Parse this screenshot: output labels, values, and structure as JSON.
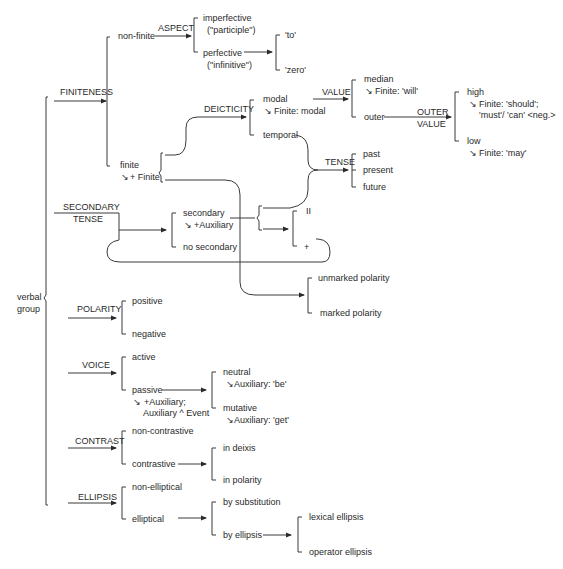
{
  "root": {
    "label_line1": "verbal",
    "label_line2": "group"
  },
  "systems": {
    "finiteness": "FINITENESS",
    "aspect": "ASPECT",
    "deicticity": "DEICTICITY",
    "value": "VALUE",
    "outer_value_line1": "OUTER",
    "outer_value_line2": "VALUE",
    "tense": "TENSE",
    "secondary_tense_line1": "SECONDARY",
    "secondary_tense_line2": "TENSE",
    "polarity": "POLARITY",
    "voice": "VOICE",
    "contrast": "CONTRAST",
    "ellipsis": "ELLIPSIS"
  },
  "features": {
    "non_finite": "non-finite",
    "imperfective": "imperfective",
    "imperfective_gloss": "(\"participle\")",
    "perfective": "perfective",
    "perfective_gloss": "(\"infinitive\")",
    "to": "'to'",
    "zero": "'zero'",
    "finite": "finite",
    "finite_realization": "+ Finite",
    "modal": "modal",
    "modal_realization": "Finite: modal",
    "temporal": "temporal",
    "median": "median",
    "median_realization": "Finite: 'will'",
    "outer": "outer",
    "high": "high",
    "high_realization_1": "Finite: 'should';",
    "high_realization_2": "'must'/ 'can' <neg.>",
    "low": "low",
    "low_realization": "Finite: 'may'",
    "past": "past",
    "present": "present",
    "future": "future",
    "secondary": "secondary",
    "secondary_realization": "+Auxiliary",
    "no_secondary": "no secondary",
    "recursion_ii": "II",
    "recursion_plus": "+",
    "unmarked_polarity": "unmarked polarity",
    "marked_polarity": "marked polarity",
    "positive": "positive",
    "negative": "negative",
    "active": "active",
    "passive": "passive",
    "passive_realization_1": "+Auxiliary;",
    "passive_realization_2": "Auxiliary ^ Event",
    "neutral": "neutral",
    "neutral_realization": "Auxiliary: 'be'",
    "mutative": "mutative",
    "mutative_realization": "Auxiliary: 'get'",
    "non_contrastive": "non-contrastive",
    "contrastive": "contrastive",
    "in_deixis": "in deixis",
    "in_polarity": "in polarity",
    "non_elliptical": "non-elliptical",
    "elliptical": "elliptical",
    "by_substitution": "by substitution",
    "by_ellipsis": "by ellipsis",
    "lexical_ellipsis": "lexical ellipsis",
    "operator_ellipsis": "operator ellipsis"
  },
  "symbols": {
    "realization_arrow": "↘"
  }
}
